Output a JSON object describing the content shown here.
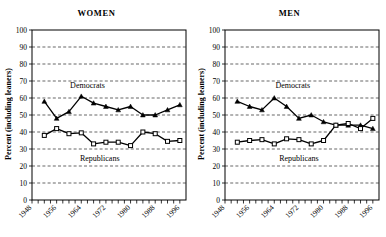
{
  "figure": {
    "background": "#ffffff",
    "line_color": "#000000"
  },
  "panels": [
    {
      "key": "women",
      "title": "WOMEN",
      "ylabel": "Percent (including leaners)",
      "series_labels": {
        "democrats": "Democrats",
        "republicans": "Republicans"
      }
    },
    {
      "key": "men",
      "title": "MEN",
      "ylabel": "Percent (including leaners)",
      "series_labels": {
        "democrats": "Democrats",
        "republicans": "Republicans"
      }
    }
  ],
  "chart_data": [
    {
      "type": "line",
      "title": "WOMEN",
      "xlabel": "",
      "ylabel": "Percent (including leaners)",
      "xlim": [
        1948,
        1998
      ],
      "ylim": [
        0,
        100
      ],
      "ytick_step": 10,
      "yticks": [
        0,
        10,
        20,
        30,
        40,
        50,
        60,
        70,
        80,
        90,
        100
      ],
      "xticks": [
        1948,
        1950,
        1952,
        1954,
        1956,
        1958,
        1960,
        1962,
        1964,
        1966,
        1968,
        1970,
        1972,
        1974,
        1976,
        1978,
        1980,
        1982,
        1984,
        1986,
        1988,
        1990,
        1992,
        1994,
        1996
      ],
      "xtick_labels": [
        "1948",
        "1956",
        "1964",
        "1972",
        "1980",
        "1988",
        "1996"
      ],
      "xtick_label_values": [
        1948,
        1956,
        1964,
        1972,
        1980,
        1988,
        1996
      ],
      "xtick_label_rotation": 45,
      "grid": true,
      "grid_axis": "y",
      "grid_style": "dashed",
      "legend": "inline-annotations",
      "x": [
        1952,
        1956,
        1960,
        1964,
        1968,
        1972,
        1976,
        1980,
        1984,
        1988,
        1992,
        1996
      ],
      "series": [
        {
          "name": "Democrats",
          "marker": "filled-triangle",
          "values": [
            58,
            48,
            52,
            61,
            57,
            55,
            53,
            55,
            50,
            50,
            53,
            56
          ]
        },
        {
          "name": "Republicans",
          "marker": "open-square",
          "values": [
            38,
            42,
            39,
            39.5,
            33,
            34,
            34,
            32,
            40,
            39,
            34.5,
            35
          ]
        }
      ],
      "annotations": [
        {
          "text": "Democrats",
          "x": 1966,
          "y": 66
        },
        {
          "text": "Republicans",
          "x": 1970,
          "y": 23
        }
      ]
    },
    {
      "type": "line",
      "title": "MEN",
      "xlabel": "",
      "ylabel": "Percent (including leaners)",
      "xlim": [
        1948,
        1998
      ],
      "ylim": [
        0,
        100
      ],
      "ytick_step": 10,
      "yticks": [
        0,
        10,
        20,
        30,
        40,
        50,
        60,
        70,
        80,
        90,
        100
      ],
      "xticks": [
        1948,
        1950,
        1952,
        1954,
        1956,
        1958,
        1960,
        1962,
        1964,
        1966,
        1968,
        1970,
        1972,
        1974,
        1976,
        1978,
        1980,
        1982,
        1984,
        1986,
        1988,
        1990,
        1992,
        1994,
        1996
      ],
      "xtick_labels": [
        "1948",
        "1956",
        "1964",
        "1972",
        "1980",
        "1988",
        "1996"
      ],
      "xtick_label_values": [
        1948,
        1956,
        1964,
        1972,
        1980,
        1988,
        1996
      ],
      "xtick_label_rotation": 45,
      "grid": true,
      "grid_axis": "y",
      "grid_style": "dashed",
      "legend": "inline-annotations",
      "x": [
        1952,
        1956,
        1960,
        1964,
        1968,
        1972,
        1976,
        1980,
        1984,
        1988,
        1992,
        1996
      ],
      "series": [
        {
          "name": "Democrats",
          "marker": "filled-triangle",
          "values": [
            58,
            55,
            53,
            60,
            55,
            48,
            50,
            46,
            44,
            44,
            44,
            42
          ]
        },
        {
          "name": "Republicans",
          "marker": "open-square",
          "values": [
            34,
            35,
            35.5,
            33,
            36,
            35.5,
            33,
            35,
            44,
            45,
            42,
            48
          ]
        }
      ],
      "annotations": [
        {
          "text": "Democrats",
          "x": 1970,
          "y": 66
        },
        {
          "text": "Republicans",
          "x": 1972,
          "y": 23
        }
      ]
    }
  ]
}
